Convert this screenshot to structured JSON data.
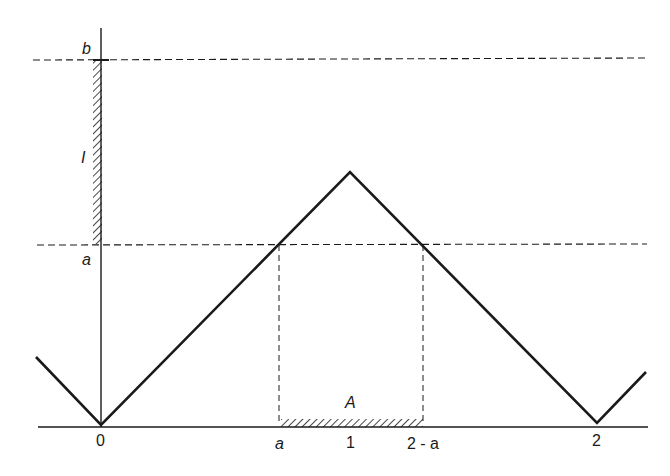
{
  "diagram": {
    "y_labels": {
      "b": "b",
      "I": "I",
      "a": "a"
    },
    "x_labels": {
      "zero": "0",
      "a": "a",
      "one": "1",
      "two_minus_a": "2 - a",
      "two": "2"
    },
    "set_label": "A",
    "colors": {
      "ink": "#1a1a1a",
      "background": "#ffffff"
    }
  }
}
